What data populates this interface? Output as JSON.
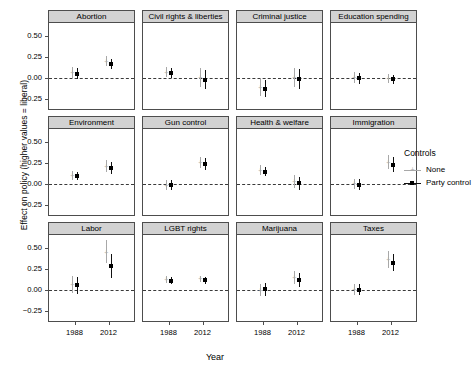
{
  "chart_data": {
    "type": "scatter",
    "title": "",
    "xlabel": "Year",
    "ylabel": "Effect on policy (higher values = liberal)",
    "ylim": [
      -0.38,
      0.66
    ],
    "yticks": [
      0.5,
      0.25,
      0.0,
      -0.25
    ],
    "ytick_labels": [
      "0.50",
      "0.25",
      "0.00",
      "-0.25"
    ],
    "x": [
      1988,
      2012
    ],
    "xtick_labels": [
      "1988",
      "2012"
    ],
    "grid": false,
    "zero_reference_line": 0.0,
    "legend": {
      "title": "Controls",
      "position": "right",
      "entries": [
        {
          "name": "None",
          "color": "#a8a8a8",
          "glyph": "plus"
        },
        {
          "name": "Party control",
          "color": "#111111",
          "glyph": "square"
        }
      ]
    },
    "facet_layout": {
      "rows": 3,
      "cols": 4
    },
    "panels": [
      {
        "label": "Abortion",
        "series": [
          {
            "name": "None",
            "points": [
              {
                "x": 1988,
                "y": 0.065,
                "lo": -0.005,
                "hi": 0.135
              },
              {
                "x": 2012,
                "y": 0.205,
                "lo": 0.145,
                "hi": 0.265
              }
            ]
          },
          {
            "name": "Party control",
            "points": [
              {
                "x": 1988,
                "y": 0.055,
                "lo": -0.01,
                "hi": 0.12
              },
              {
                "x": 2012,
                "y": 0.165,
                "lo": 0.11,
                "hi": 0.225
              }
            ]
          }
        ]
      },
      {
        "label": "Civil rights & liberties",
        "series": [
          {
            "name": "None",
            "points": [
              {
                "x": 1988,
                "y": 0.07,
                "lo": 0.01,
                "hi": 0.13
              },
              {
                "x": 2012,
                "y": 0.01,
                "lo": -0.105,
                "hi": 0.12
              }
            ]
          },
          {
            "name": "Party control",
            "points": [
              {
                "x": 1988,
                "y": 0.06,
                "lo": 0.0,
                "hi": 0.12
              },
              {
                "x": 2012,
                "y": -0.02,
                "lo": -0.13,
                "hi": 0.095
              }
            ]
          }
        ]
      },
      {
        "label": "Criminal justice",
        "series": [
          {
            "name": "None",
            "points": [
              {
                "x": 1988,
                "y": -0.11,
                "lo": -0.215,
                "hi": -0.005
              },
              {
                "x": 2012,
                "y": 0.01,
                "lo": -0.105,
                "hi": 0.125
              }
            ]
          },
          {
            "name": "Party control",
            "points": [
              {
                "x": 1988,
                "y": -0.125,
                "lo": -0.23,
                "hi": -0.02
              },
              {
                "x": 2012,
                "y": -0.015,
                "lo": -0.135,
                "hi": 0.105
              }
            ]
          }
        ]
      },
      {
        "label": "Education spending",
        "series": [
          {
            "name": "None",
            "points": [
              {
                "x": 1988,
                "y": 0.005,
                "lo": -0.06,
                "hi": 0.07
              },
              {
                "x": 2012,
                "y": -0.005,
                "lo": -0.055,
                "hi": 0.05
              }
            ]
          },
          {
            "name": "Party control",
            "points": [
              {
                "x": 1988,
                "y": 0.0,
                "lo": -0.065,
                "hi": 0.065
              },
              {
                "x": 2012,
                "y": -0.015,
                "lo": -0.065,
                "hi": 0.04
              }
            ]
          }
        ]
      },
      {
        "label": "Environment",
        "series": [
          {
            "name": "None",
            "points": [
              {
                "x": 1988,
                "y": 0.105,
                "lo": 0.055,
                "hi": 0.155
              },
              {
                "x": 2012,
                "y": 0.215,
                "lo": 0.145,
                "hi": 0.29
              }
            ]
          },
          {
            "name": "Party control",
            "points": [
              {
                "x": 1988,
                "y": 0.095,
                "lo": 0.045,
                "hi": 0.145
              },
              {
                "x": 2012,
                "y": 0.19,
                "lo": 0.12,
                "hi": 0.265
              }
            ]
          }
        ]
      },
      {
        "label": "Gun control",
        "series": [
          {
            "name": "None",
            "points": [
              {
                "x": 1988,
                "y": -0.01,
                "lo": -0.07,
                "hi": 0.05
              },
              {
                "x": 2012,
                "y": 0.26,
                "lo": 0.19,
                "hi": 0.33
              }
            ]
          },
          {
            "name": "Party control",
            "points": [
              {
                "x": 1988,
                "y": -0.015,
                "lo": -0.075,
                "hi": 0.045
              },
              {
                "x": 2012,
                "y": 0.24,
                "lo": 0.17,
                "hi": 0.31
              }
            ]
          }
        ]
      },
      {
        "label": "Health & welfare",
        "series": [
          {
            "name": "None",
            "points": [
              {
                "x": 1988,
                "y": 0.165,
                "lo": 0.11,
                "hi": 0.225
              },
              {
                "x": 2012,
                "y": 0.03,
                "lo": -0.045,
                "hi": 0.105
              }
            ]
          },
          {
            "name": "Party control",
            "points": [
              {
                "x": 1988,
                "y": 0.15,
                "lo": 0.095,
                "hi": 0.21
              },
              {
                "x": 2012,
                "y": 0.01,
                "lo": -0.065,
                "hi": 0.085
              }
            ]
          }
        ]
      },
      {
        "label": "Immigration",
        "series": [
          {
            "name": "None",
            "points": [
              {
                "x": 1988,
                "y": 0.005,
                "lo": -0.055,
                "hi": 0.065
              },
              {
                "x": 2012,
                "y": 0.265,
                "lo": 0.18,
                "hi": 0.355
              }
            ]
          },
          {
            "name": "Party control",
            "points": [
              {
                "x": 1988,
                "y": -0.005,
                "lo": -0.065,
                "hi": 0.06
              },
              {
                "x": 2012,
                "y": 0.23,
                "lo": 0.14,
                "hi": 0.32
              }
            ]
          }
        ]
      },
      {
        "label": "Labor",
        "series": [
          {
            "name": "None",
            "points": [
              {
                "x": 1988,
                "y": 0.07,
                "lo": -0.035,
                "hi": 0.165
              },
              {
                "x": 2012,
                "y": 0.455,
                "lo": 0.32,
                "hi": 0.6
              }
            ]
          },
          {
            "name": "Party control",
            "points": [
              {
                "x": 1988,
                "y": 0.06,
                "lo": -0.045,
                "hi": 0.16
              },
              {
                "x": 2012,
                "y": 0.29,
                "lo": 0.15,
                "hi": 0.43
              }
            ]
          }
        ]
      },
      {
        "label": "LGBT rights",
        "series": [
          {
            "name": "None",
            "points": [
              {
                "x": 1988,
                "y": 0.125,
                "lo": 0.085,
                "hi": 0.165
              },
              {
                "x": 2012,
                "y": 0.135,
                "lo": 0.095,
                "hi": 0.175
              }
            ]
          },
          {
            "name": "Party control",
            "points": [
              {
                "x": 1988,
                "y": 0.115,
                "lo": 0.075,
                "hi": 0.155
              },
              {
                "x": 2012,
                "y": 0.12,
                "lo": 0.08,
                "hi": 0.16
              }
            ]
          }
        ]
      },
      {
        "label": "Marijuana",
        "series": [
          {
            "name": "None",
            "points": [
              {
                "x": 1988,
                "y": 0.0,
                "lo": -0.075,
                "hi": 0.075
              },
              {
                "x": 2012,
                "y": 0.155,
                "lo": 0.08,
                "hi": 0.235
              }
            ]
          },
          {
            "name": "Party control",
            "points": [
              {
                "x": 1988,
                "y": 0.01,
                "lo": -0.065,
                "hi": 0.085
              },
              {
                "x": 2012,
                "y": 0.12,
                "lo": 0.04,
                "hi": 0.2
              }
            ]
          }
        ]
      },
      {
        "label": "Taxes",
        "series": [
          {
            "name": "None",
            "points": [
              {
                "x": 1988,
                "y": 0.01,
                "lo": -0.055,
                "hi": 0.075
              },
              {
                "x": 2012,
                "y": 0.37,
                "lo": 0.27,
                "hi": 0.47
              }
            ]
          },
          {
            "name": "Party control",
            "points": [
              {
                "x": 1988,
                "y": 0.005,
                "lo": -0.06,
                "hi": 0.07
              },
              {
                "x": 2012,
                "y": 0.33,
                "lo": 0.23,
                "hi": 0.43
              }
            ]
          }
        ]
      }
    ]
  }
}
